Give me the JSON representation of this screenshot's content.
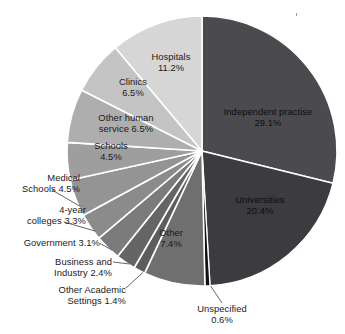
{
  "chart_data": {
    "type": "pie",
    "title": "",
    "subtitle": "",
    "xlabel": "",
    "ylabel": "",
    "legend_position": "none",
    "grid": false,
    "units": "percent",
    "total": 100.0,
    "start_angle_deg": 0,
    "direction": "clockwise",
    "categories": [
      "Independent practise",
      "Universities",
      "Unspecified",
      "Other",
      "Other Academic Settings",
      "Business and Industry",
      "Government",
      "4-year colleges",
      "Medical Schools",
      "Schools",
      "Other human service",
      "Clinics",
      "Hospitals"
    ],
    "values": [
      29.1,
      20.4,
      0.6,
      7.4,
      1.4,
      2.4,
      3.1,
      3.3,
      4.5,
      4.5,
      6.5,
      6.5,
      11.2
    ],
    "colors": [
      "#4a4a4f",
      "#3b3b40",
      "#121214",
      "#6f6f6f",
      "#5d5d5d",
      "#656565",
      "#7b7b7b",
      "#8b8b8b",
      "#949494",
      "#9e9e9e",
      "#aeaeae",
      "#c4c4c4",
      "#d6d6d6"
    ],
    "slices": [
      {
        "label": "Independent practise",
        "value": 29.1,
        "value_text": "29.1%",
        "color": "#4a4a4f",
        "label_placement": "inside"
      },
      {
        "label": "Universities",
        "value": 20.4,
        "value_text": "20.4%",
        "color": "#3b3b40",
        "label_placement": "inside"
      },
      {
        "label": "Unspecified",
        "value": 0.6,
        "value_text": "0.6%",
        "color": "#121214",
        "label_placement": "outside-leader"
      },
      {
        "label": "Other",
        "value": 7.4,
        "value_text": "7.4%",
        "color": "#6f6f6f",
        "label_placement": "inside"
      },
      {
        "label": "Other Academic Settings",
        "value": 1.4,
        "value_text": "1.4%",
        "color": "#5d5d5d",
        "label_placement": "outside-leader"
      },
      {
        "label": "Business and Industry",
        "value": 2.4,
        "value_text": "2.4%",
        "color": "#656565",
        "label_placement": "outside-leader"
      },
      {
        "label": "Government",
        "value": 3.1,
        "value_text": "3.1%",
        "color": "#7b7b7b",
        "label_placement": "outside-leader"
      },
      {
        "label": "4-year colleges",
        "value": 3.3,
        "value_text": "3.3%",
        "color": "#8b8b8b",
        "label_placement": "outside-leader"
      },
      {
        "label": "Medical Schools",
        "value": 4.5,
        "value_text": "4.5%",
        "color": "#949494",
        "label_placement": "outside-leader"
      },
      {
        "label": "Schools",
        "value": 4.5,
        "value_text": "4.5%",
        "color": "#9e9e9e",
        "label_placement": "inside"
      },
      {
        "label": "Other human service",
        "value": 6.5,
        "value_text": "6.5%",
        "color": "#aeaeae",
        "label_placement": "inside"
      },
      {
        "label": "Clinics",
        "value": 6.5,
        "value_text": "6.5%",
        "color": "#c4c4c4",
        "label_placement": "inside"
      },
      {
        "label": "Hospitals",
        "value": 11.2,
        "value_text": "11.2%",
        "color": "#d6d6d6",
        "label_placement": "inside"
      }
    ]
  },
  "labels": {
    "independent_practise_name": "Independent practise",
    "independent_practise_value": "29.1%",
    "universities_name": "Universities",
    "universities_value": "20.4%",
    "unspecified_name": "Unspecified",
    "unspecified_value": "0.6%",
    "other_name": "Other",
    "other_value": "7.4%",
    "other_academic_line1": "Other Academic",
    "other_academic_line2": "Settings 1.4%",
    "business_line1": "Business and",
    "business_line2": "Industry 2.4%",
    "government_text": "Government 3.1%",
    "four_year_line1": "4-year",
    "four_year_line2": "colleges 3.3%",
    "medical_schools_line1": "Medical",
    "medical_schools_line2": "Schools 4.5%",
    "schools_name": "Schools",
    "schools_value": "4.5%",
    "other_human_line1": "Other human",
    "other_human_line2": "service 6.5%",
    "clinics_name": "Clinics",
    "clinics_value": "6.5%",
    "hospitals_name": "Hospitals",
    "hospitals_value": "11.2%"
  },
  "style": {
    "background": "#ffffff",
    "separator_color": "#ffffff",
    "leader_line_color": "#555555",
    "text_color": "#1a1a1a"
  }
}
